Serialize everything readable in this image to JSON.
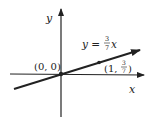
{
  "diagram": {
    "axes": {
      "x_label": "x",
      "y_label": "y"
    },
    "line": {
      "equation_lhs": "y =",
      "slope_num": "3",
      "slope_den": "7",
      "equation_var": "x"
    },
    "points": [
      {
        "label_text": "(0, 0)"
      },
      {
        "label_prefix": "(1,",
        "frac_num": "3",
        "frac_den": "7",
        "label_suffix": ")"
      }
    ],
    "colors": {
      "ink": "#222222",
      "background": "#ffffff"
    }
  }
}
